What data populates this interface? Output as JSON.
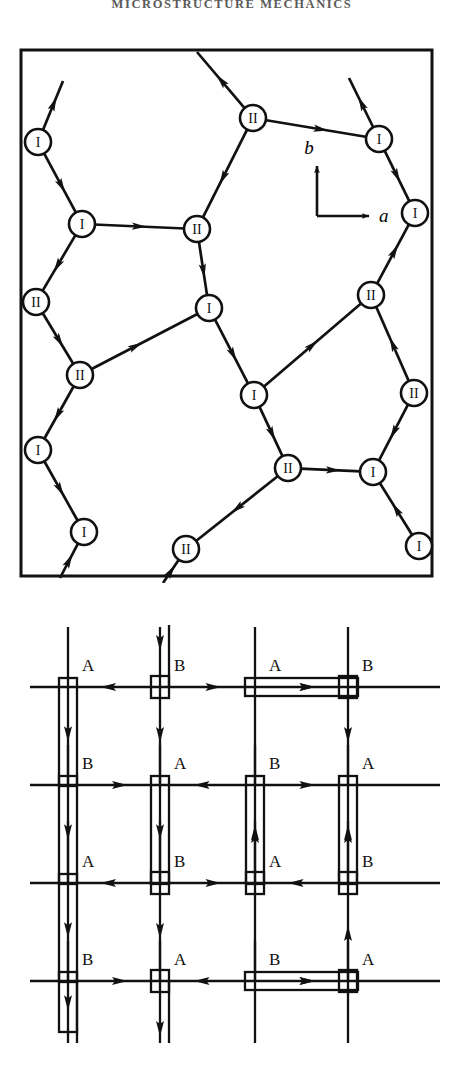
{
  "running_head": "MICROSTRUCTURE MECHANICS",
  "figure": {
    "panels": [
      {
        "id": "hexagonal-network",
        "name": "hexagonal-dislocation-network",
        "frame": {
          "x": 21,
          "y": 12,
          "w": 411,
          "h": 526,
          "stroke": "#111111",
          "stroke_width": 3
        },
        "axes": {
          "origin": {
            "x": 317,
            "y": 178
          },
          "b_label": "b",
          "a_label": "a",
          "b_tip": {
            "x": 317,
            "y": 128
          },
          "a_tip": {
            "x": 369,
            "y": 178
          }
        },
        "node_radius": 13,
        "node_label_I": "I",
        "node_label_II": "II",
        "nodes": [
          {
            "id": "n1",
            "x": 38,
            "y": 104,
            "label": "I"
          },
          {
            "id": "n2",
            "x": 82,
            "y": 186,
            "label": "I"
          },
          {
            "id": "n3",
            "x": 36,
            "y": 264,
            "label": "II"
          },
          {
            "id": "n4",
            "x": 80,
            "y": 337,
            "label": "II"
          },
          {
            "id": "n5",
            "x": 38,
            "y": 412,
            "label": "I"
          },
          {
            "id": "n6",
            "x": 84,
            "y": 494,
            "label": "I"
          },
          {
            "id": "n7",
            "x": 253,
            "y": 80,
            "label": "II"
          },
          {
            "id": "n8",
            "x": 197,
            "y": 191,
            "label": "II"
          },
          {
            "id": "n9",
            "x": 209,
            "y": 270,
            "label": "I"
          },
          {
            "id": "n10",
            "x": 254,
            "y": 357,
            "label": "I"
          },
          {
            "id": "n11",
            "x": 186,
            "y": 511,
            "label": "II"
          },
          {
            "id": "n12",
            "x": 379,
            "y": 101,
            "label": "I"
          },
          {
            "id": "n13",
            "x": 415,
            "y": 175,
            "label": "I"
          },
          {
            "id": "n14",
            "x": 371,
            "y": 257,
            "label": "II"
          },
          {
            "id": "n15",
            "x": 414,
            "y": 355,
            "label": "II"
          },
          {
            "id": "n16",
            "x": 373,
            "y": 434,
            "label": "I"
          },
          {
            "id": "n17",
            "x": 419,
            "y": 508,
            "label": "I"
          },
          {
            "id": "n18",
            "x": 288,
            "y": 430,
            "label": "II"
          }
        ],
        "edges": [
          {
            "from": [
              63,
              43
            ],
            "to": [
              38,
              104
            ],
            "arrow": "to-from",
            "arrow_at": 0.45
          },
          {
            "from": [
              82,
              186
            ],
            "to": [
              38,
              104
            ],
            "arrow": "to-start",
            "arrow_at": 0.45
          },
          {
            "from": [
              36,
              264
            ],
            "to": [
              82,
              186
            ],
            "arrow": "to-start",
            "arrow_at": 0.45
          },
          {
            "from": [
              80,
              337
            ],
            "to": [
              36,
              264
            ],
            "arrow": "to-start",
            "arrow_at": 0.45
          },
          {
            "from": [
              38,
              412
            ],
            "to": [
              80,
              337
            ],
            "arrow": "to-start",
            "arrow_at": 0.45
          },
          {
            "from": [
              84,
              494
            ],
            "to": [
              38,
              412
            ],
            "arrow": "to-start",
            "arrow_at": 0.52
          },
          {
            "from": [
              84,
              494
            ],
            "to": [
              60,
              540
            ],
            "arrow": "to-start",
            "arrow_at": 0.5
          },
          {
            "from": [
              197,
              191
            ],
            "to": [
              82,
              186
            ],
            "arrow": "to-start",
            "arrow_at": 0.5
          },
          {
            "from": [
              80,
              337
            ],
            "to": [
              209,
              270
            ],
            "arrow": "to-end",
            "arrow_at": 0.42
          },
          {
            "from": [
              253,
              80
            ],
            "to": [
              197,
              14
            ],
            "arrow": "to-end",
            "arrow_at": 0.5
          },
          {
            "from": [
              197,
              191
            ],
            "to": [
              253,
              80
            ],
            "arrow": "to-start",
            "arrow_at": 0.45
          },
          {
            "from": [
              209,
              270
            ],
            "to": [
              197,
              191
            ],
            "arrow": "to-start",
            "arrow_at": 0.45
          },
          {
            "from": [
              254,
              357
            ],
            "to": [
              209,
              270
            ],
            "arrow": "to-start",
            "arrow_at": 0.45
          },
          {
            "from": [
              288,
              430
            ],
            "to": [
              254,
              357
            ],
            "arrow": "to-start",
            "arrow_at": 0.45
          },
          {
            "from": [
              186,
              511
            ],
            "to": [
              288,
              430
            ],
            "arrow": "to-start",
            "arrow_at": 0.5
          },
          {
            "from": [
              186,
              511
            ],
            "to": [
              163,
              545
            ],
            "arrow": "to-start",
            "arrow_at": 0.5
          },
          {
            "from": [
              253,
              80
            ],
            "to": [
              379,
              101
            ],
            "arrow": "to-end",
            "arrow_at": 0.55
          },
          {
            "from": [
              379,
              101
            ],
            "to": [
              349,
              40
            ],
            "arrow": "to-end",
            "arrow_at": 0.5
          },
          {
            "from": [
              379,
              101
            ],
            "to": [
              415,
              175
            ],
            "arrow": "to-end",
            "arrow_at": 0.5
          },
          {
            "from": [
              415,
              175
            ],
            "to": [
              371,
              257
            ],
            "arrow": "to-start",
            "arrow_at": 0.45
          },
          {
            "from": [
              371,
              257
            ],
            "to": [
              254,
              357
            ],
            "arrow": "to-end-left",
            "arrow_at": 0.5
          },
          {
            "from": [
              371,
              257
            ],
            "to": [
              414,
              355
            ],
            "arrow": "to-start",
            "arrow_at": 0.5
          },
          {
            "from": [
              414,
              355
            ],
            "to": [
              373,
              434
            ],
            "arrow": "to-end",
            "arrow_at": 0.5
          },
          {
            "from": [
              288,
              430
            ],
            "to": [
              373,
              434
            ],
            "arrow": "to-end",
            "arrow_at": 0.55
          },
          {
            "from": [
              373,
              434
            ],
            "to": [
              419,
              508
            ],
            "arrow": "to-start",
            "arrow_at": 0.5
          }
        ]
      },
      {
        "id": "rectangular-grid",
        "name": "rectangular-dislocation-grid",
        "rows_y": [
          92,
          190,
          288,
          386
        ],
        "cols_x": [
          68,
          160,
          255,
          348
        ],
        "row_line_x_start": 30,
        "row_line_x_end": 440,
        "labels_A": "A",
        "labels_B": "B",
        "grid_labels": [
          [
            "A",
            "B",
            "A",
            "B"
          ],
          [
            "B",
            "A",
            "B",
            "A"
          ],
          [
            "A",
            "B",
            "A",
            "B"
          ],
          [
            "B",
            "A",
            "B",
            "A"
          ]
        ]
      }
    ]
  }
}
